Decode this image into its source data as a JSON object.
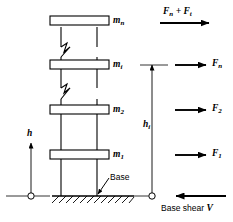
{
  "figure": {
    "background": "#ffffff",
    "line_color": "#000000"
  },
  "structure": {
    "label": "building-frame",
    "floors": [
      {
        "id": "floor-n",
        "mass_label": "m",
        "mass_sub": "n",
        "slab_y": 22
      },
      {
        "id": "floor-i",
        "mass_label": "m",
        "mass_sub": "i",
        "slab_y": 65
      },
      {
        "id": "floor-2",
        "mass_label": "m",
        "mass_sub": "2",
        "slab_y": 110
      },
      {
        "id": "floor-1",
        "mass_label": "m",
        "mass_sub": "1",
        "slab_y": 155
      }
    ],
    "break_symbols": 2,
    "base_callout": "Base"
  },
  "height_axis": {
    "label": "h",
    "arrow_direction": "up"
  },
  "hi_axis": {
    "label": "h",
    "sublabel": "i",
    "arrow_direction": "up"
  },
  "forces": [
    {
      "id": "force-top",
      "label": "F",
      "sub": "n",
      "extra": " + F",
      "extra_sub": "t",
      "direction": "right",
      "y": 22
    },
    {
      "id": "force-n",
      "label": "F",
      "sub": "n",
      "direction": "right",
      "y": 65
    },
    {
      "id": "force-2",
      "label": "F",
      "sub": "2",
      "direction": "right",
      "y": 110
    },
    {
      "id": "force-1",
      "label": "F",
      "sub": "1",
      "direction": "right",
      "y": 155
    }
  ],
  "base_shear": {
    "text": "Base shear ",
    "symbol": "V",
    "direction": "left"
  }
}
